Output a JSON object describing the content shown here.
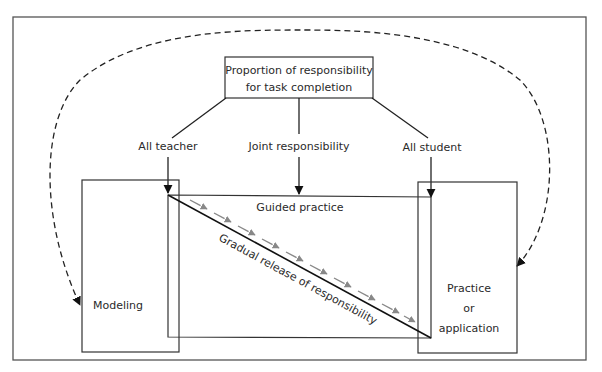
{
  "diagram": {
    "title_box": {
      "line1": "Proportion of responsibility",
      "line2": "for task completion"
    },
    "branches": {
      "left": "All teacher",
      "middle": "Joint responsibility",
      "right": "All student"
    },
    "boxes": {
      "modeling": "Modeling",
      "guided": "Guided practice",
      "practice_line1": "Practice",
      "practice_line2": "or",
      "practice_line3": "application"
    },
    "diagonal_label": "Gradual release of responsibility",
    "colors": {
      "stroke": "#222222",
      "release_arrows": "#888888",
      "background": "#ffffff"
    }
  }
}
